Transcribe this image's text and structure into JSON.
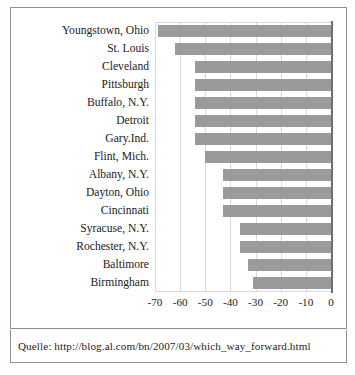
{
  "caption": "Quelle: http://blog.al.com/bn/2007/03/which_way_forward.html",
  "chart_data": {
    "type": "bar",
    "orientation": "horizontal",
    "title": "",
    "subtitle": "",
    "xlabel": "",
    "ylabel": "",
    "xlim": [
      -70,
      0
    ],
    "ylim": null,
    "grid": true,
    "legend": false,
    "legend_position": "none",
    "bar_color": "#9a9a9a",
    "axis_color": "#6e6e6e",
    "gridline_color": "#d7d7d7",
    "xticks": [
      "-70",
      "-60",
      "-50",
      "-40",
      "-30",
      "-20",
      "-10",
      "0"
    ],
    "xtick_values": [
      -70,
      -60,
      -50,
      -40,
      -30,
      -20,
      -10,
      0
    ],
    "categories": [
      "Youngstown, Ohio",
      "St. Louis",
      "Cleveland",
      "Pittsburgh",
      "Buffalo, N.Y.",
      "Detroit",
      "Gary.Ind.",
      "Flint, Mich.",
      "Albany, N.Y.",
      "Dayton, Ohio",
      "Cincinnati",
      "Syracuse, N.Y.",
      "Rochester, N.Y.",
      "Baltimore",
      "Birmingham"
    ],
    "values": [
      -69,
      -62,
      -54,
      -54,
      -54,
      -54,
      -54,
      -50,
      -43,
      -43,
      -43,
      -36,
      -36,
      -33,
      -31
    ]
  }
}
